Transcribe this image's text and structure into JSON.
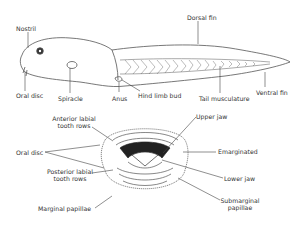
{
  "tadpole": {
    "labels": {
      "nostril": "Nostril",
      "dorsal_fin": "Dorsal fin",
      "oral_disc": "Oral disc",
      "spiracle": "Spiracle",
      "anus": "Anus",
      "hind_limb_bud": "Hind limb bud",
      "tail_musculature": "Tail musculature",
      "ventral_fin": "Ventral fin"
    }
  },
  "mouth": {
    "labels": {
      "anterior_labial_1": "Anterior labial",
      "anterior_labial_2": "tooth rows",
      "oral_disc": "Oral disc",
      "posterior_labial_1": "Posterior labial",
      "posterior_labial_2": "tooth rows",
      "marginal_papillae": "Marginal papillae",
      "upper_jaw": "Upper jaw",
      "emarginated": "Emarginated",
      "lower_jaw": "Lower jaw",
      "submarginal_1": "Submarginal",
      "submarginal_2": "papillae"
    }
  },
  "colors": {
    "line": "#444444",
    "fill": "#ffffff",
    "jaw": "#222222"
  }
}
